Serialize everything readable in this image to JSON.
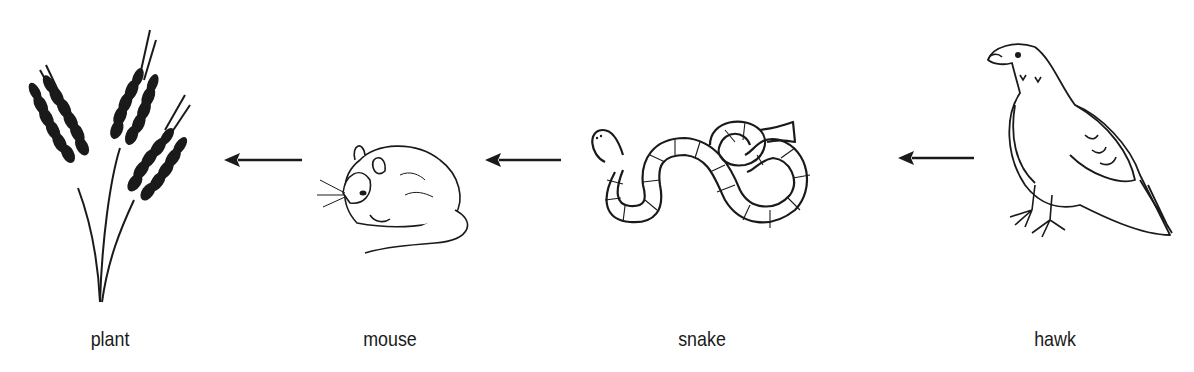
{
  "diagram": {
    "type": "food-chain",
    "organisms": [
      {
        "id": "plant",
        "label": "plant"
      },
      {
        "id": "mouse",
        "label": "mouse"
      },
      {
        "id": "snake",
        "label": "snake"
      },
      {
        "id": "hawk",
        "label": "hawk"
      }
    ],
    "arrows": [
      {
        "from": "mouse",
        "to": "plant"
      },
      {
        "from": "snake",
        "to": "mouse"
      },
      {
        "from": "hawk",
        "to": "snake"
      }
    ],
    "arrow_direction": "left",
    "colors": {
      "ink": "#1a1a1a",
      "background": "#ffffff"
    }
  }
}
